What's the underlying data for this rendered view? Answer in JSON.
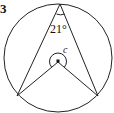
{
  "question_number": "3",
  "diagram": {
    "inscribed_angle_label": "21°",
    "central_angle_label": "c",
    "colors": {
      "stroke": "#222222",
      "background": "#ffffff"
    }
  }
}
